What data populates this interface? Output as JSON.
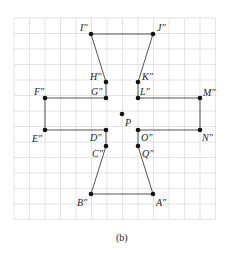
{
  "figure": {
    "caption": "(b)",
    "grid": {
      "x0": 14,
      "y0": 18,
      "cell": 15.5,
      "cols": 13,
      "rows": 13,
      "color": "#dcdcdc"
    },
    "colors": {
      "line": "#555555",
      "point": "#111111"
    },
    "center": {
      "label": "P",
      "x": 122,
      "y": 114
    },
    "points": [
      {
        "id": "I",
        "label": "I″",
        "x": 91,
        "y": 34,
        "lx": 80,
        "ly": 31
      },
      {
        "id": "J",
        "label": "J″",
        "x": 153,
        "y": 34,
        "lx": 157,
        "ly": 31
      },
      {
        "id": "H",
        "label": "H″",
        "x": 106,
        "y": 82,
        "lx": 90,
        "ly": 80
      },
      {
        "id": "K",
        "label": "K″",
        "x": 138,
        "y": 82,
        "lx": 142,
        "ly": 80
      },
      {
        "id": "G",
        "label": "G″",
        "x": 106,
        "y": 98,
        "lx": 91,
        "ly": 95
      },
      {
        "id": "L",
        "label": "L″",
        "x": 138,
        "y": 98,
        "lx": 140,
        "ly": 95
      },
      {
        "id": "F",
        "label": "F″",
        "x": 45,
        "y": 98,
        "lx": 34,
        "ly": 95
      },
      {
        "id": "M",
        "label": "M″",
        "x": 200,
        "y": 98,
        "lx": 203,
        "ly": 96
      },
      {
        "id": "E",
        "label": "E″",
        "x": 45,
        "y": 130,
        "lx": 32,
        "ly": 142
      },
      {
        "id": "N",
        "label": "N″",
        "x": 200,
        "y": 130,
        "lx": 202,
        "ly": 141
      },
      {
        "id": "D",
        "label": "D″",
        "x": 106,
        "y": 130,
        "lx": 90,
        "ly": 141
      },
      {
        "id": "O",
        "label": "O″",
        "x": 138,
        "y": 130,
        "lx": 141,
        "ly": 141
      },
      {
        "id": "C",
        "label": "C″",
        "x": 106,
        "y": 146,
        "lx": 92,
        "ly": 157
      },
      {
        "id": "Q",
        "label": "Q″",
        "x": 138,
        "y": 146,
        "lx": 142,
        "ly": 157
      },
      {
        "id": "B",
        "label": "B″",
        "x": 91,
        "y": 194,
        "lx": 77,
        "ly": 206
      },
      {
        "id": "A",
        "label": "A″",
        "x": 153,
        "y": 194,
        "lx": 156,
        "ly": 206
      }
    ],
    "polygon_order": [
      "I",
      "J",
      "K",
      "L",
      "M",
      "N",
      "O",
      "Q",
      "A",
      "B",
      "C",
      "D",
      "E",
      "F",
      "G",
      "H"
    ]
  }
}
